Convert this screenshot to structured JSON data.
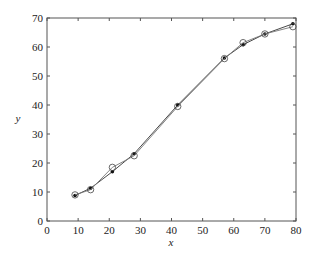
{
  "chart_data": {
    "type": "line",
    "title": "",
    "xlabel": "x",
    "ylabel": "y",
    "xlim": [
      0,
      80
    ],
    "ylim": [
      0,
      70
    ],
    "xticks": [
      0,
      10,
      20,
      30,
      40,
      50,
      60,
      70,
      80
    ],
    "yticks": [
      0,
      10,
      20,
      30,
      40,
      50,
      60,
      70
    ],
    "grid": false,
    "legend": null,
    "series": [
      {
        "name": "filled-dot series",
        "marker": "filled-dot",
        "x": [
          9,
          14,
          21,
          28,
          42,
          57,
          63,
          70,
          79
        ],
        "y": [
          8.8,
          11.3,
          17,
          23.2,
          40,
          56.2,
          60.8,
          64.5,
          68
        ]
      },
      {
        "name": "open-circle series",
        "marker": "open-circle",
        "x": [
          9,
          14,
          21,
          28,
          42,
          57,
          63,
          70,
          79
        ],
        "y": [
          9,
          10.8,
          18.5,
          22.5,
          39.5,
          56,
          61.5,
          64.5,
          67
        ]
      }
    ]
  },
  "caption": ""
}
